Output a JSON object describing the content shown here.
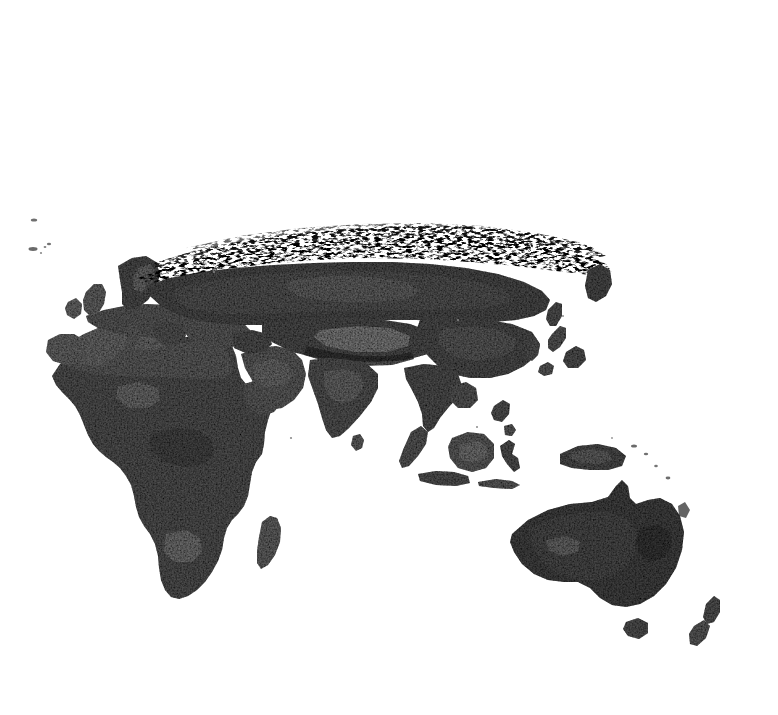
{
  "figure": {
    "kind": "raster-map-plate",
    "title": "",
    "background_color": "#ffffff",
    "frame_color": "#9a9a9a",
    "frame": {
      "x": -6,
      "y": 34,
      "width": 744,
      "height": 636,
      "left_edge_cropped": true
    },
    "map_area": {
      "x": 0,
      "y": 34,
      "width": 738,
      "height": 636
    }
  },
  "map": {
    "name": "eastern-hemisphere-grayscale-raster",
    "projection_hint": "equirectangular-like",
    "hemisphere": "eastern",
    "land_color_range": [
      "#2a2a2a",
      "#9c9c9c"
    ],
    "ocean_color": "#ffffff",
    "texture": "speckled grayscale raster, dithered high-latitude transition band",
    "regions": [
      {
        "label": "Iceland",
        "kind": "island"
      },
      {
        "label": "Faroe Islands",
        "kind": "island"
      },
      {
        "label": "British Isles",
        "kind": "island-group"
      },
      {
        "label": "Ireland",
        "kind": "island"
      },
      {
        "label": "Scandinavia",
        "kind": "peninsula"
      },
      {
        "label": "Europe",
        "kind": "continent-part"
      },
      {
        "label": "Iberian Peninsula",
        "kind": "peninsula"
      },
      {
        "label": "Mediterranean Sea",
        "kind": "sea"
      },
      {
        "label": "Italy",
        "kind": "peninsula"
      },
      {
        "label": "Black Sea",
        "kind": "sea"
      },
      {
        "label": "Caspian Sea",
        "kind": "sea"
      },
      {
        "label": "Aral Sea",
        "kind": "sea"
      },
      {
        "label": "Anatolia",
        "kind": "peninsula"
      },
      {
        "label": "Arabian Peninsula",
        "kind": "peninsula"
      },
      {
        "label": "Red Sea",
        "kind": "sea"
      },
      {
        "label": "Persian Gulf",
        "kind": "sea"
      },
      {
        "label": "North Africa / Sahara",
        "kind": "region"
      },
      {
        "label": "Sub-Saharan Africa",
        "kind": "region"
      },
      {
        "label": "Horn of Africa",
        "kind": "region"
      },
      {
        "label": "Southern Africa",
        "kind": "region"
      },
      {
        "label": "Madagascar",
        "kind": "island"
      },
      {
        "label": "Siberia",
        "kind": "region"
      },
      {
        "label": "Arctic tundra transition band",
        "kind": "dithered-band"
      },
      {
        "label": "Central Asia",
        "kind": "region"
      },
      {
        "label": "Himalaya / Tibetan Plateau",
        "kind": "mountain-range"
      },
      {
        "label": "India",
        "kind": "subcontinent"
      },
      {
        "label": "Sri Lanka",
        "kind": "island"
      },
      {
        "label": "China",
        "kind": "region"
      },
      {
        "label": "Korean Peninsula",
        "kind": "peninsula"
      },
      {
        "label": "Japan",
        "kind": "island-group"
      },
      {
        "label": "Kamchatka",
        "kind": "peninsula"
      },
      {
        "label": "Sakhalin",
        "kind": "island"
      },
      {
        "label": "Indochina",
        "kind": "peninsula"
      },
      {
        "label": "Sumatra",
        "kind": "island"
      },
      {
        "label": "Java",
        "kind": "island"
      },
      {
        "label": "Borneo",
        "kind": "island"
      },
      {
        "label": "Sulawesi",
        "kind": "island"
      },
      {
        "label": "Philippines",
        "kind": "island-group"
      },
      {
        "label": "New Guinea",
        "kind": "island"
      },
      {
        "label": "Australia",
        "kind": "continent"
      },
      {
        "label": "Tasmania",
        "kind": "island"
      },
      {
        "label": "New Zealand",
        "kind": "island-group"
      },
      {
        "label": "Solomon Islands",
        "kind": "island-group"
      },
      {
        "label": "New Caledonia",
        "kind": "island"
      }
    ]
  },
  "legend": {
    "present": false,
    "entries": []
  },
  "axes": {
    "present": false,
    "tick_labels": []
  },
  "annotations": []
}
